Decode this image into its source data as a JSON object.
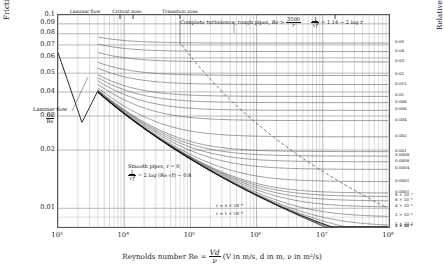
{
  "chart_data": {
    "type": "line",
    "xlabel": "Reynolds number Re = Vd/ν (V in m/s, d in m, ν in m²/s)",
    "ylabel": "Friction factor f = 2h_L dg / LV²",
    "y2label": "Relative roughness r = ε/d (ε in mm, d in mm)",
    "xscale": "log",
    "yscale": "log",
    "xlim": [
      1000,
      100000000
    ],
    "ylim": [
      0.008,
      0.1
    ],
    "grid": true,
    "legend": "none",
    "xticklabels": [
      "10³",
      "10⁴",
      "10⁵",
      "10⁶",
      "10⁷",
      "10⁸"
    ],
    "yticklabels": [
      "0.1",
      "0.09",
      "0.08",
      "0.07",
      "0.06",
      "0.05",
      "0.04",
      "0.03",
      "0.02",
      "0.01"
    ],
    "yticks": [
      0.1,
      0.09,
      0.08,
      0.07,
      0.06,
      0.05,
      0.04,
      0.03,
      0.02,
      0.01
    ],
    "laminar": {
      "label": "Laminar flow f = 64/Re",
      "equation": "f = 64 / Re",
      "x": [
        1000,
        2300
      ],
      "y": [
        0.064,
        0.0278
      ]
    },
    "smooth_pipe": {
      "label": "Smooth pipes, r = 0",
      "equation": "1/√f = 2 log (Re √f) − 0.8",
      "roughness": 0
    },
    "complete_turbulence": {
      "label": "Complete turbulence, rough pipes",
      "condition": "Re > 3500/r",
      "equation": "1/√f = 1.14 − 2 log r"
    },
    "roughness_curves": [
      0.05,
      0.04,
      0.03,
      0.02,
      0.015,
      0.01,
      0.008,
      0.006,
      0.004,
      0.002,
      0.001,
      0.0008,
      0.0006,
      0.0004,
      0.0002,
      0.0001,
      8e-05,
      6e-05,
      4e-05,
      2e-05,
      1e-05,
      5e-06,
      1e-06
    ],
    "right_tick_labels": [
      "0.05",
      "0.04",
      "0.03",
      "0.02",
      "0.015",
      "0.01",
      "0.008",
      "0.006",
      "0.004",
      "0.002",
      "0.001",
      "0.0008",
      "0.0006",
      "0.0004",
      "0.0002",
      "0.0001",
      "8 × 10⁻⁵",
      "6 × 10⁻⁵",
      "4 × 10⁻⁵",
      "2 × 10⁻⁵",
      "1 × 10⁻⁵",
      "5 × 10⁻⁶",
      "1 × 10⁻⁶"
    ]
  },
  "axes": {
    "y": {
      "prefix": "Friction factor",
      "symbol": "f",
      "eq_num": "2h",
      "eq_num_sub": "L",
      "eq_num_tail": "dg",
      "eq_den": "LV",
      "eq_den_sup": "2",
      "ticks": [
        "0.1",
        "0.09",
        "0.08",
        "0.07",
        "0.06",
        "0.05",
        "0.04",
        "0.03",
        "0.02",
        "0.01"
      ]
    },
    "x": {
      "prefix": "Reynolds number",
      "symbol": "Re",
      "eq_num": "Vd",
      "eq_den": "ν",
      "units": "(V in m/s, d in m, ν in m²/s)",
      "ticks": [
        "10³",
        "10⁴",
        "10⁵",
        "10⁶",
        "10⁷",
        "10⁸"
      ]
    },
    "right": {
      "prefix": "Relative roughness",
      "symbol": "r",
      "eq_num": "ε",
      "eq_den": "d",
      "units": "(ε in mm, d in mm)",
      "ticks": [
        "0.05",
        "0.04",
        "0.03",
        "0.02",
        "0.015",
        "0.01",
        "0.008",
        "0.006",
        "0.004",
        "0.002",
        "0.001",
        "0.0008",
        "0.0006",
        "0.0004",
        "0.0002",
        "0.0001",
        "8 × 10⁻⁵",
        "6 × 10⁻⁵",
        "4 × 10⁻⁵",
        "2 × 10⁻⁵",
        "1 × 10⁻⁵",
        "5 × 10⁻⁶",
        "1 × 10⁻⁶"
      ]
    }
  },
  "zones": [
    {
      "name": "laminar",
      "label": "Laminar flow"
    },
    {
      "name": "critical",
      "label": "Critical zone"
    },
    {
      "name": "transition",
      "label": "Transition zone"
    }
  ],
  "annotations": {
    "laminar_flow": {
      "line1": "Laminar flow",
      "num": "64",
      "den": "Re",
      "full": "Laminar flow f = 64/Re"
    },
    "complete_turbulence": {
      "text": "Complete turbulence, rough pipes,",
      "cond_symbol": "Re >",
      "cond_num": "3500",
      "cond_den": "r",
      "eq_lhs_num": "1",
      "eq_lhs_den": "√f",
      "eq_rhs": "= 1.14 − 2 log r"
    },
    "smooth_pipes": {
      "line1": "Smooth pipes, r = 0",
      "eq_lhs_num": "1",
      "eq_lhs_den": "√f",
      "eq_rhs": "= 2 log (Re √f) − 0.8"
    },
    "inner_roughness": [
      {
        "label": "r = 5 × 10⁻⁶"
      },
      {
        "label": "r = 1 × 10⁻⁶"
      }
    ]
  }
}
